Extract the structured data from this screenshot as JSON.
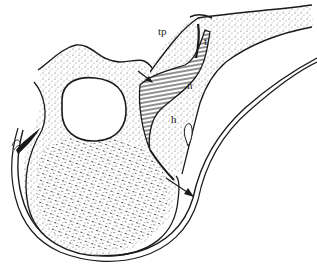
{
  "diagram": {
    "type": "anatomical cross-section line drawing",
    "labels": [
      {
        "id": "tp",
        "text": "tp",
        "x": 158,
        "y": 35
      },
      {
        "id": "t",
        "text": "t",
        "x": 204,
        "y": 45
      },
      {
        "id": "n",
        "text": "n",
        "x": 187,
        "y": 89
      },
      {
        "id": "h",
        "text": "h",
        "x": 171,
        "y": 123
      }
    ],
    "arrows": [
      {
        "id": "arrow-upper",
        "from": [
          138,
          71
        ],
        "to": [
          152,
          82
        ]
      },
      {
        "id": "arrow-lower",
        "from": [
          193,
          196
        ],
        "to": [
          173,
          182
        ]
      }
    ],
    "colors": {
      "ink": "#1a1a1a",
      "background": "#ffffff",
      "stipple": "#444444"
    }
  }
}
